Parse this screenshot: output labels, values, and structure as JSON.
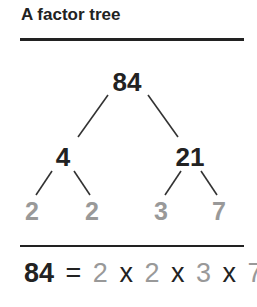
{
  "title": "A factor tree",
  "colors": {
    "text": "#222222",
    "prime": "#999999",
    "rule": "#222222"
  },
  "tree": {
    "root": "84",
    "children": [
      {
        "value": "4",
        "children": [
          "2",
          "2"
        ]
      },
      {
        "value": "21",
        "children": [
          "3",
          "7"
        ]
      }
    ]
  },
  "equation": {
    "number": "84",
    "equals": "=",
    "factors": [
      "2",
      "2",
      "3",
      "7"
    ],
    "times": "x"
  }
}
